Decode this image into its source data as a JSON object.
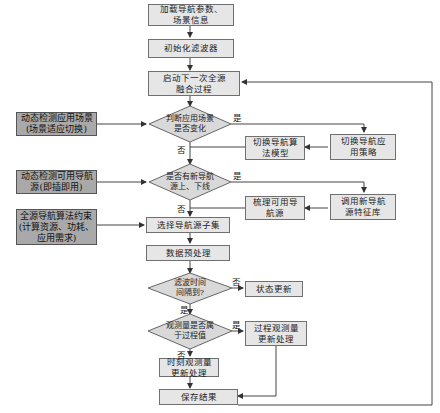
{
  "diagram": {
    "type": "flowchart",
    "nodes": {
      "load": "加载导航参数、\n场景信息",
      "init": "初始化滤波器",
      "start": "启动下一次全源\n融合过程",
      "judge_scene": "判断应用场景\n是否变化",
      "switch_model": "切换导航算\n法模型",
      "switch_strategy": "切换导航应\n用策略",
      "new_source": "是否有新导航\n源上、下线",
      "sort_sources": "梳理可用导\n航源",
      "call_library": "调用新导航\n源特征库",
      "select_subset": "选择导航源子集",
      "preprocess": "数据预处理",
      "filter_time": "滤波时间\n间隔到?",
      "state_update": "状态更新",
      "is_process": "观测量是否属\n于过程值",
      "process_update": "过程观测量\n更新处理",
      "moment_update": "时刻观测量\n更新处理",
      "save": "保存结果",
      "ext_scene": "动态检测应用场景\n(场景适应切换)",
      "ext_source": "动态检测可用导航\n源(即插即用)",
      "ext_constraint": "全源导航算法约束\n(计算资源、功耗、\n应用需求)"
    },
    "edge_labels": {
      "yes": "是",
      "no": "否"
    }
  }
}
